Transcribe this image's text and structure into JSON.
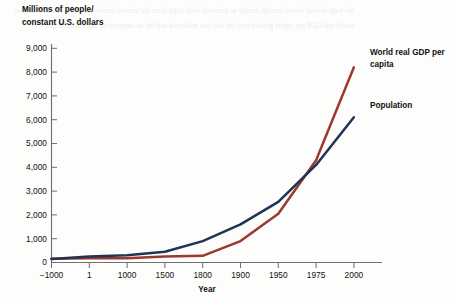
{
  "chart_data": {
    "type": "line",
    "title": "",
    "ylabel": "Millions of people/\nconstant U.S. dollars",
    "ylabel_line1": "Millions of people/",
    "ylabel_line2": "constant U.S. dollars",
    "xlabel": "Year",
    "categories": [
      "−1000",
      "1",
      "1000",
      "1500",
      "1800",
      "1900",
      "1950",
      "1975",
      "2000"
    ],
    "x_tick_labels": [
      "−1000",
      "1",
      "1000",
      "1500",
      "1800",
      "1900",
      "1950",
      "1975",
      "2000"
    ],
    "y_tick_labels": [
      "0",
      "1,000",
      "2,000",
      "3,000",
      "4,000",
      "5,000",
      "6,000",
      "7,000",
      "8,000",
      "9,000"
    ],
    "y_tick_values": [
      0,
      1000,
      2000,
      3000,
      4000,
      5000,
      6000,
      7000,
      8000,
      9000
    ],
    "ylim": [
      0,
      9000
    ],
    "grid": false,
    "legend_position": "right-inline",
    "series": [
      {
        "name": "Population",
        "label_line1": "Population",
        "color": "#1f3356",
        "values": [
          150,
          250,
          300,
          450,
          900,
          1600,
          2550,
          4100,
          6100
        ]
      },
      {
        "name": "World real GDP per capita",
        "label_line1": "World real GDP per",
        "label_line2": "capita",
        "color": "#9d382f",
        "values": [
          160,
          175,
          180,
          250,
          280,
          900,
          2050,
          4300,
          8200
        ]
      }
    ]
  },
  "ghost": {
    "text": "the page behind shows through faintly as mirrored body copy from the printed textbook column which discusses world real GDP per capita growth over the last two millennia and the accompanying population series"
  }
}
